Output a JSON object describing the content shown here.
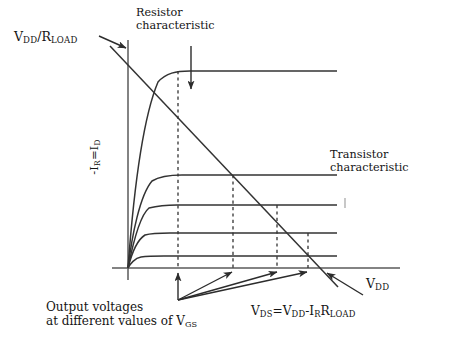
{
  "figure": {
    "title_implied": "MOSFET load-line diagram",
    "background_color": "#ffffff",
    "line_color": "#333333",
    "text_color": "#141414"
  },
  "axes": {
    "origin": {
      "x": 128,
      "y": 268
    },
    "y_axis": {
      "x": 128,
      "top_y": 40,
      "bottom_y": 280,
      "label_html": "-I<sub>R</sub>=I<sub>D</sub>"
    },
    "x_axis": {
      "y": 268,
      "left_x": 112,
      "right_x": 400,
      "label_html": "V<sub>DD</sub>"
    }
  },
  "labels": {
    "resistor_characteristic": {
      "line1": "Resistor",
      "line2": "characteristic"
    },
    "transistor_characteristic": {
      "line1": "Transistor",
      "line2": "characteristic"
    },
    "vdd_over_rload_html": "V<sub>DD</sub>/R<sub>LOAD</sub>",
    "vdd_axis_html": "V<sub>DD</sub>",
    "vds_equation_html": "V<sub>DS</sub>=V<sub>DD</sub>-I<sub>R</sub>R<sub>LOAD</sub>",
    "output_voltages": {
      "line1": "Output voltages",
      "line2_html": "at different values of V<sub>GS</sub>"
    }
  },
  "chart_data": {
    "type": "line",
    "title": "",
    "xlabel": "V_DD",
    "ylabel": "-I_R = I_D",
    "grid": false,
    "legend": "annotations",
    "load_line": {
      "name": "Resistor characteristic (load line)",
      "description": "Straight load line from V_DD/R_LOAD on the current axis down to V_DD on the voltage axis",
      "start": {
        "x_px": 110,
        "y_px": 46,
        "meaning": "V_DD/R_LOAD intercept on current axis"
      },
      "end": {
        "x_px": 338,
        "y_px": 287,
        "meaning": "V_DD intercept on voltage axis"
      },
      "axis_crossing": {
        "x_px": 320,
        "y_px": 268
      }
    },
    "transistor_curves": {
      "name": "Transistor characteristic family (I_D vs V_DS at different V_GS)",
      "count": 5,
      "saturation_levels_px_y": [
        71,
        175,
        205,
        233,
        256
      ],
      "knee_x_px": [
        160,
        152,
        148,
        143,
        140
      ],
      "right_end_x_px": 337,
      "note": "Highest curve corresponds to the largest V_GS; curves rise steeply from origin then saturate flat"
    },
    "operating_points": {
      "description": "Intersections of the load line with each transistor curve; dashed verticals drop to the voltage axis giving the output voltages",
      "dashed_verticals_x_px": [
        178,
        233,
        277,
        308
      ],
      "intersection_y_px": [
        71,
        175,
        205,
        233
      ]
    },
    "annotation_arrows": [
      {
        "name": "vdd-rload-arrow",
        "from": [
          100,
          37
        ],
        "to": [
          126,
          48
        ]
      },
      {
        "name": "resistor-characteristic-arrow",
        "from": [
          191,
          47
        ],
        "to": [
          191,
          88
        ]
      },
      {
        "name": "operating-point-arrow-1",
        "from": [
          178,
          300
        ],
        "to": [
          178,
          272
        ]
      },
      {
        "name": "operating-point-arrow-2",
        "from": [
          178,
          300
        ],
        "to": [
          232,
          272
        ]
      },
      {
        "name": "operating-point-arrow-3",
        "from": [
          178,
          300
        ],
        "to": [
          277,
          272
        ]
      },
      {
        "name": "operating-point-arrow-4",
        "from": [
          178,
          300
        ],
        "to": [
          307,
          272
        ]
      },
      {
        "name": "vdd-axis-arrow",
        "from": [
          362,
          294
        ],
        "to": [
          326,
          272
        ]
      }
    ]
  }
}
